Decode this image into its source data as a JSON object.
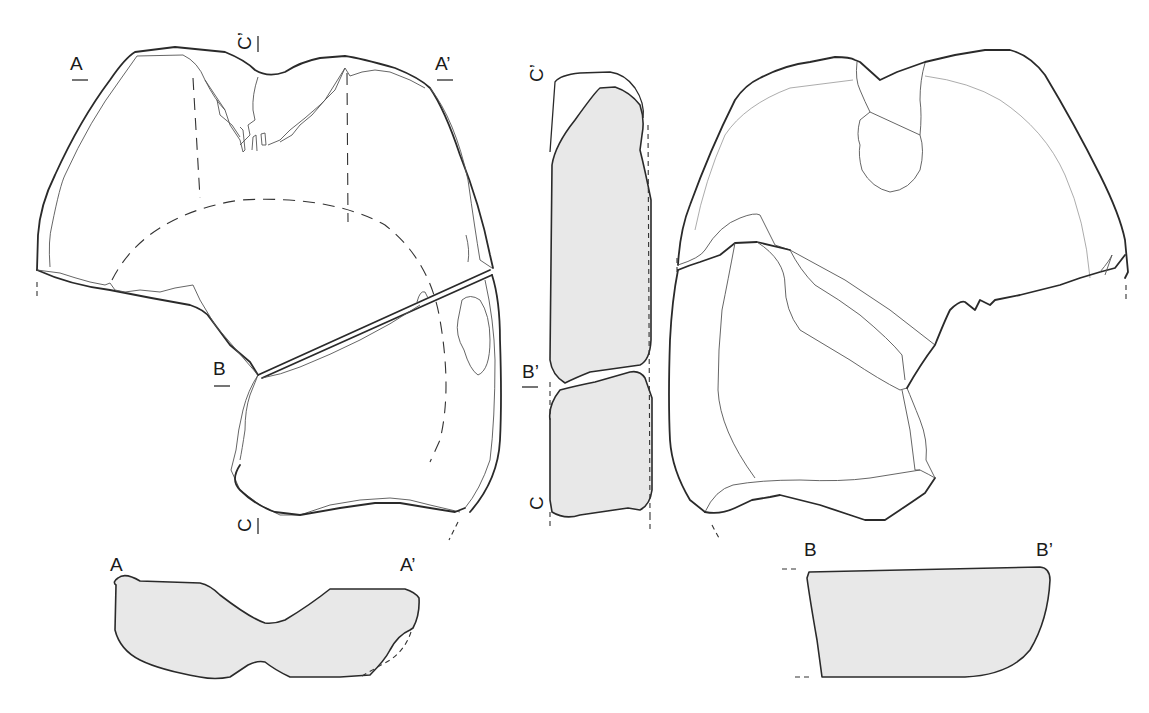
{
  "figure": {
    "type": "archaeological technical drawing",
    "views": [
      {
        "id": "front-view",
        "position": "left"
      },
      {
        "id": "side-section-view",
        "position": "center",
        "shading": "section fill"
      },
      {
        "id": "back-view",
        "position": "right"
      }
    ],
    "cross_sections": [
      {
        "id": "section-A",
        "position": "bottom-left",
        "start_label": "A",
        "end_label": "A’"
      },
      {
        "id": "section-B",
        "position": "bottom-right",
        "start_label": "B",
        "end_label": "B’"
      }
    ],
    "colors": {
      "line": "#2a2a2a",
      "section_fill": "#e8e8e8",
      "background": "#ffffff"
    }
  },
  "labels": {
    "front_A": "A",
    "front_A_prime": "A’",
    "front_B": "B",
    "front_C_top": "C’",
    "front_C_bottom": "C",
    "side_C_prime": "C’",
    "side_B_prime": "B’",
    "side_C": "C",
    "section_a_start": "A",
    "section_a_end": "A’",
    "section_b_start": "B",
    "section_b_end": "B’"
  }
}
